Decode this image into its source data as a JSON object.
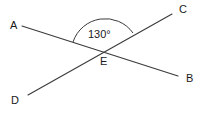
{
  "figure": {
    "type": "geometry-diagram",
    "background_color": "#ffffff",
    "stroke_color": "#3a3a3a",
    "text_color": "#1a1a1a"
  },
  "points": {
    "a": {
      "label": "A",
      "x": 22,
      "y": 26,
      "label_x": 10,
      "label_y": 20
    },
    "b": {
      "label": "B",
      "x": 178,
      "y": 76,
      "label_x": 186,
      "label_y": 73
    },
    "c": {
      "label": "C",
      "x": 172,
      "y": 14,
      "label_x": 179,
      "label_y": 4
    },
    "d": {
      "label": "D",
      "x": 28,
      "y": 95,
      "label_x": 11,
      "label_y": 95
    },
    "e": {
      "label": "E",
      "x": 105,
      "y": 53,
      "label_x": 100,
      "label_y": 56
    }
  },
  "segments": [
    {
      "name": "line-ab",
      "from": "A",
      "to": "B",
      "x1": 22,
      "y1": 26,
      "x2": 178,
      "y2": 76
    },
    {
      "name": "line-dc",
      "from": "D",
      "to": "C",
      "x1": 28,
      "y1": 95,
      "x2": 172,
      "y2": 14
    }
  ],
  "angle": {
    "name": "angle-AEC",
    "value": "130°",
    "vertex": "E",
    "rays": [
      "EA",
      "EC"
    ],
    "label_x": 88,
    "label_y": 29,
    "arc_path": "M 73 42 A 34 34 0 0 1 133 33"
  }
}
